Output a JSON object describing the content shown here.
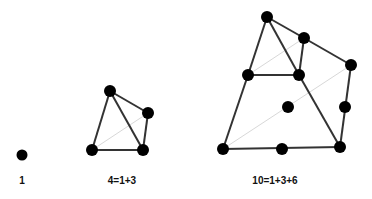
{
  "colors": {
    "edge": "#333333",
    "faint_edge": "#d8d8d8",
    "node": "#000000",
    "background": "#ffffff"
  },
  "figures": [
    {
      "label": "1",
      "nodes": [
        [
          22,
          155
        ]
      ],
      "edges": [],
      "faint_edges": []
    },
    {
      "label": "4=1+3",
      "nodes": [
        [
          110,
          91
        ],
        [
          148,
          113
        ],
        [
          92,
          150
        ],
        [
          143,
          150
        ]
      ],
      "edges": [
        [
          0,
          1
        ],
        [
          0,
          2
        ],
        [
          0,
          3
        ],
        [
          1,
          3
        ],
        [
          2,
          3
        ]
      ],
      "faint_edges": [
        [
          2,
          1
        ]
      ]
    },
    {
      "label": "10=1+3+6",
      "nodes": [
        [
          267,
          17
        ],
        [
          304,
          38
        ],
        [
          351,
          65
        ],
        [
          248,
          75
        ],
        [
          299,
          75
        ],
        [
          288,
          107
        ],
        [
          345,
          107
        ],
        [
          223,
          149
        ],
        [
          282,
          149
        ],
        [
          340,
          147
        ]
      ],
      "edges": [
        [
          0,
          3
        ],
        [
          0,
          4
        ],
        [
          0,
          1
        ],
        [
          1,
          2
        ],
        [
          1,
          4
        ],
        [
          3,
          4
        ],
        [
          3,
          7
        ],
        [
          4,
          9
        ],
        [
          2,
          6
        ],
        [
          6,
          9
        ],
        [
          7,
          8
        ],
        [
          8,
          9
        ]
      ],
      "faint_edges": [
        [
          3,
          1
        ],
        [
          7,
          2
        ]
      ]
    }
  ]
}
